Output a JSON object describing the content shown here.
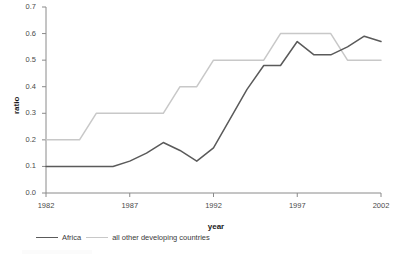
{
  "chart_data": {
    "type": "line",
    "title": "",
    "xlabel": "year",
    "ylabel": "ratio",
    "xlim": [
      1982,
      2002
    ],
    "ylim": [
      0.0,
      0.7
    ],
    "grid": false,
    "legend_position": "bottom-left",
    "xticks": [
      "1982",
      "1987",
      "1992",
      "1997",
      "2002"
    ],
    "xtick_values": [
      1982,
      1987,
      1992,
      1997,
      2002
    ],
    "yticks": [
      "0.0",
      "0.1",
      "0.2",
      "0.3",
      "0.4",
      "0.5",
      "0.6",
      "0.7"
    ],
    "ytick_values": [
      0.0,
      0.1,
      0.2,
      0.3,
      0.4,
      0.5,
      0.6,
      0.7
    ],
    "x": [
      1982,
      1983,
      1984,
      1985,
      1986,
      1987,
      1988,
      1989,
      1990,
      1991,
      1992,
      1993,
      1994,
      1995,
      1996,
      1997,
      1998,
      1999,
      2000,
      2001,
      2002
    ],
    "series": [
      {
        "name": "Africa",
        "color": "#5a5a5a",
        "values": [
          0.1,
          0.1,
          0.1,
          0.1,
          0.1,
          0.12,
          0.15,
          0.19,
          0.16,
          0.12,
          0.17,
          0.28,
          0.39,
          0.48,
          0.48,
          0.57,
          0.52,
          0.52,
          0.55,
          0.59,
          0.57
        ]
      },
      {
        "name": "all other developing countries",
        "color": "#c8c8c8",
        "values": [
          0.2,
          0.2,
          0.2,
          0.3,
          0.3,
          0.3,
          0.3,
          0.3,
          0.4,
          0.4,
          0.5,
          0.5,
          0.5,
          0.5,
          0.6,
          0.6,
          0.6,
          0.6,
          0.5,
          0.5,
          0.5
        ]
      }
    ],
    "axis_color": "#8a8a8a",
    "text_color": "#4a4a4a"
  }
}
